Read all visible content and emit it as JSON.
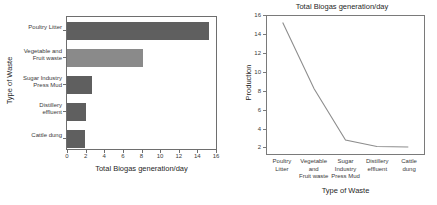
{
  "chart_data": [
    {
      "type": "bar",
      "orientation": "horizontal",
      "title": "",
      "categories": [
        "Poultry Litter",
        "Vegetable and\nFruit waste",
        "Sugar Industry\nPress Mud",
        "Distillery\neffluent",
        "Cattle dung"
      ],
      "values": [
        15.3,
        8.2,
        2.7,
        2.0,
        1.95
      ],
      "xlabel": "Total Biogas generation/day",
      "ylabel": "Type of Waste",
      "xlim": [
        0,
        16
      ],
      "xticks": [
        0,
        2,
        4,
        6,
        8,
        10,
        12,
        14,
        16
      ],
      "grid": false,
      "legend": "none",
      "bar_color": "#5f5f5f"
    },
    {
      "type": "line",
      "title": "Total Biogas generation/day",
      "categories": [
        "Poultry\nLitter",
        "Vegetable\nand\nFruit waste",
        "Sugar\nIndustry\nPress Mud",
        "Distillery\neffluent",
        "Cattle\ndung"
      ],
      "values": [
        15.3,
        8.2,
        2.7,
        2.0,
        1.95
      ],
      "xlabel": "Type of Waste",
      "ylabel": "Production",
      "ylim": [
        1.2,
        16
      ],
      "yticks": [
        2,
        4,
        6,
        8,
        10,
        12,
        14,
        16
      ],
      "grid": false,
      "legend": "none",
      "line_color": "#8d8d8d"
    }
  ],
  "bar_chart": {
    "xlabel": "Total Biogas generation/day",
    "ylabel": "Type of Waste",
    "xticks": [
      "0",
      "2",
      "4",
      "6",
      "8",
      "10",
      "12",
      "14",
      "16"
    ],
    "categories": [
      {
        "label": "Poultry Litter",
        "value": 15.3
      },
      {
        "label": "Vegetable and\nFruit waste",
        "value": 8.2
      },
      {
        "label": "Sugar Industry\nPress Mud",
        "value": 2.7
      },
      {
        "label": "Distillery\neffluent",
        "value": 2.0
      },
      {
        "label": "Cattle dung",
        "value": 1.95
      }
    ]
  },
  "line_chart": {
    "title": "Total Biogas generation/day",
    "xlabel": "Type of Waste",
    "ylabel": "Production",
    "yticks": [
      "16",
      "14",
      "12",
      "10",
      "8",
      "6",
      "4",
      "2"
    ],
    "categories": [
      {
        "label": "Poultry\nLitter",
        "value": 15.3
      },
      {
        "label": "Vegetable\nand\nFruit waste",
        "value": 8.2
      },
      {
        "label": "Sugar\nIndustry\nPress Mud",
        "value": 2.7
      },
      {
        "label": "Distillery\neffluent",
        "value": 2.0
      },
      {
        "label": "Cattle\ndung",
        "value": 1.95
      }
    ]
  }
}
